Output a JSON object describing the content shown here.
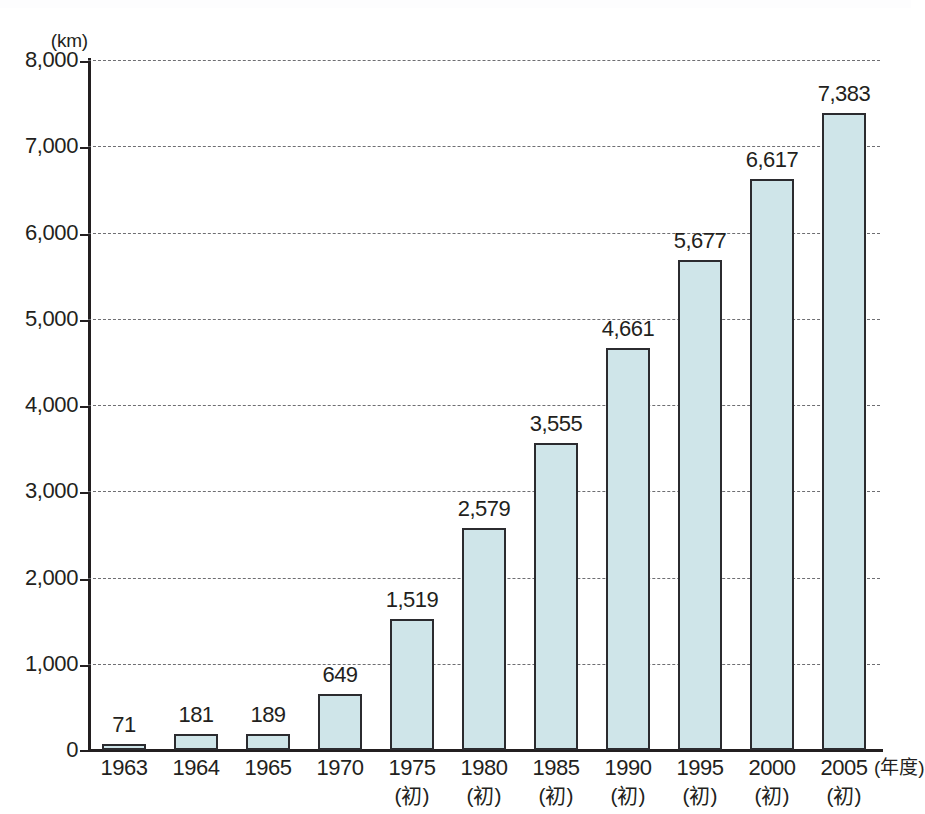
{
  "chart_data": {
    "type": "bar",
    "title": "",
    "xlabel": "年度",
    "ylabel": "km",
    "y_unit_label": "(km)",
    "x_unit_label": "(年度)",
    "ylim": [
      0,
      8000
    ],
    "ytick_step": 1000,
    "grid": true,
    "grid_style": "dashed",
    "legend": "none",
    "bar_fill_color": "#cfe5e9",
    "bar_border_color": "#2b2b2f",
    "axis_color": "#231f20",
    "gridline_color": "#6e6e72",
    "ytick_labels": [
      "8,000",
      "7,000",
      "6,000",
      "5,000",
      "4,000",
      "3,000",
      "2,000",
      "1,000",
      "0"
    ],
    "ytick_values": [
      8000,
      7000,
      6000,
      5000,
      4000,
      3000,
      2000,
      1000,
      0
    ],
    "categories": [
      "1963",
      "1964",
      "1965",
      "1970",
      "1975",
      "1980",
      "1985",
      "1990",
      "1995",
      "2000",
      "2005"
    ],
    "category_sublabels": [
      "",
      "",
      "",
      "",
      "(初)",
      "(初)",
      "(初)",
      "(初)",
      "(初)",
      "(初)",
      "(初)"
    ],
    "values": [
      71,
      181,
      189,
      649,
      1519,
      2579,
      3555,
      4661,
      5677,
      6617,
      7383
    ],
    "value_labels": [
      "71",
      "181",
      "189",
      "649",
      "1,519",
      "2,579",
      "3,555",
      "4,661",
      "5,677",
      "6,617",
      "7,383"
    ]
  }
}
